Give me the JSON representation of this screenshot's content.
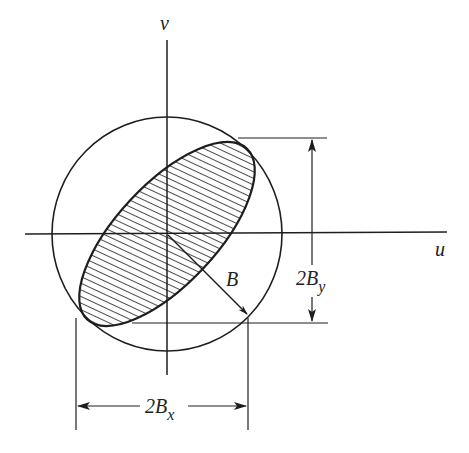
{
  "figure": {
    "colors": {
      "ink": "#1e1e1e",
      "background": "#ffffff"
    }
  },
  "axes": {
    "horizontal_label": "u",
    "vertical_label": "v"
  },
  "labels": {
    "radius": "B",
    "width_dimension_main": "2B",
    "width_dimension_sub": "x",
    "height_dimension_main": "2B",
    "height_dimension_sub": "y"
  },
  "shapes": {
    "circle": {
      "cx": 167,
      "cy": 234,
      "rx": 115,
      "ry": 117
    },
    "ellipse": {
      "cx": 167,
      "cy": 234,
      "semi_major": 117,
      "semi_minor": 50,
      "rotation_deg": -47,
      "fill": "hatched"
    }
  }
}
